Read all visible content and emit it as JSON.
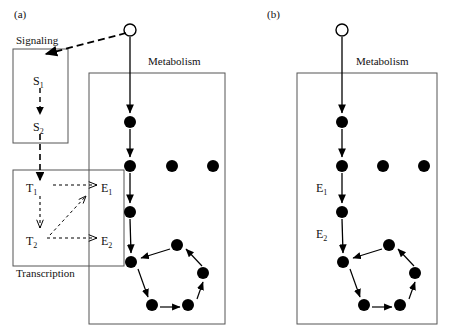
{
  "figure": {
    "panels": [
      {
        "id": "a",
        "label": "(a)",
        "label_pos": {
          "x": 14,
          "y": 8
        },
        "boxes": [
          {
            "name": "signaling-box",
            "label": "Signaling",
            "label_pos": {
              "x": 16,
              "y": 34
            },
            "rect": {
              "x": 13,
              "y": 49,
              "w": 55,
              "h": 94
            }
          },
          {
            "name": "transcription-box",
            "label": "Transcription",
            "label_pos": {
              "x": 16,
              "y": 267
            },
            "rect": {
              "x": 13,
              "y": 170,
              "w": 111,
              "h": 96
            }
          },
          {
            "name": "metabolism-box",
            "label": "Metabolism",
            "label_pos": {
              "x": 148,
              "y": 55
            },
            "rect": {
              "x": 89,
              "y": 73,
              "w": 136,
              "h": 251
            }
          }
        ],
        "species": [
          {
            "name": "s1",
            "label": "S",
            "sub": "1",
            "x": 33,
            "y": 80
          },
          {
            "name": "s2",
            "label": "S",
            "sub": "2",
            "x": 33,
            "y": 126
          },
          {
            "name": "t1",
            "label": "T",
            "sub": "1",
            "x": 26,
            "y": 188
          },
          {
            "name": "t2",
            "label": "T",
            "sub": "2",
            "x": 26,
            "y": 241
          },
          {
            "name": "e1",
            "label": "E",
            "sub": "1",
            "x": 101,
            "y": 188
          },
          {
            "name": "e2",
            "label": "E",
            "sub": "2",
            "x": 101,
            "y": 241
          }
        ],
        "open_circle": {
          "cx": 130,
          "cy": 30,
          "r": 6
        },
        "chain_nodes": [
          {
            "cx": 130,
            "cy": 122,
            "r": 6
          },
          {
            "cx": 130,
            "cy": 166,
            "r": 6
          },
          {
            "cx": 130,
            "cy": 212,
            "r": 6
          },
          {
            "cx": 131,
            "cy": 262,
            "r": 6
          }
        ],
        "row_nodes": [
          {
            "cx": 172,
            "cy": 166,
            "r": 6
          },
          {
            "cx": 213,
            "cy": 166,
            "r": 6
          }
        ],
        "cycle_nodes": [
          {
            "cx": 131,
            "cy": 262,
            "r": 6
          },
          {
            "cx": 152,
            "cy": 305,
            "r": 6
          },
          {
            "cx": 188,
            "cy": 305,
            "r": 6
          },
          {
            "cx": 203,
            "cy": 273,
            "r": 6
          },
          {
            "cx": 177,
            "cy": 245,
            "r": 6
          }
        ]
      },
      {
        "id": "b",
        "label": "(b)",
        "label_pos": {
          "x": 267,
          "y": 8
        },
        "boxes": [
          {
            "name": "metabolism-box",
            "label": "Metabolism",
            "label_pos": {
              "x": 356,
              "y": 55
            },
            "rect": {
              "x": 297,
              "y": 73,
              "w": 140,
              "h": 251
            }
          }
        ],
        "species": [
          {
            "name": "e1",
            "label": "E",
            "sub": "1",
            "x": 316,
            "y": 188
          },
          {
            "name": "e2",
            "label": "E",
            "sub": "2",
            "x": 316,
            "y": 234
          }
        ],
        "open_circle": {
          "cx": 342,
          "cy": 30,
          "r": 6
        },
        "chain_nodes": [
          {
            "cx": 342,
            "cy": 122,
            "r": 6
          },
          {
            "cx": 342,
            "cy": 166,
            "r": 6
          },
          {
            "cx": 342,
            "cy": 212,
            "r": 6
          },
          {
            "cx": 343,
            "cy": 262,
            "r": 6
          }
        ],
        "row_nodes": [
          {
            "cx": 383,
            "cy": 166,
            "r": 6
          },
          {
            "cx": 424,
            "cy": 166,
            "r": 6
          }
        ],
        "cycle_nodes": [
          {
            "cx": 343,
            "cy": 262,
            "r": 6
          },
          {
            "cx": 364,
            "cy": 305,
            "r": 6
          },
          {
            "cx": 400,
            "cy": 305,
            "r": 6
          },
          {
            "cx": 415,
            "cy": 273,
            "r": 6
          },
          {
            "cx": 389,
            "cy": 245,
            "r": 6
          }
        ]
      }
    ],
    "colors": {
      "stroke": "#000000",
      "box_stroke": "#666666",
      "node_fill": "#000000",
      "background": "#ffffff"
    }
  }
}
